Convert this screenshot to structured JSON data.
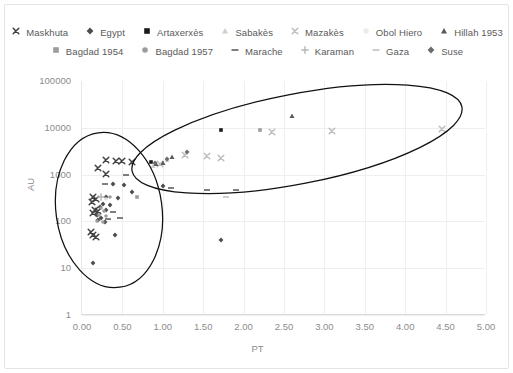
{
  "chart_data": {
    "type": "scatter",
    "title": "",
    "xlabel": "PT",
    "ylabel": "AU",
    "xlim": [
      0.0,
      5.0
    ],
    "ylim": [
      1,
      100000
    ],
    "yscale": "log",
    "xscale": "linear",
    "grid": true,
    "legend_position": "top",
    "xticks": [
      "0.00",
      "0.50",
      "1.00",
      "1.50",
      "2.00",
      "2.50",
      "3.00",
      "3.50",
      "4.00",
      "4.50",
      "5.00"
    ],
    "yticks": [
      "1",
      "10",
      "100",
      "1000",
      "10000",
      "100000"
    ],
    "annotations": [
      {
        "name": "cluster-ellipse-left",
        "note": "tall narrow ellipse enclosing dense low-PT cluster"
      },
      {
        "name": "cluster-ellipse-right",
        "note": "wide flat ellipse enclosing high-PT high-AU points"
      }
    ],
    "series": [
      {
        "name": "Maskhuta",
        "marker": "x",
        "color": "#404040",
        "points": [
          [
            0.3,
            2050
          ],
          [
            0.42,
            2000
          ],
          [
            0.5,
            1950
          ],
          [
            0.2,
            1400
          ],
          [
            0.3,
            1050
          ],
          [
            0.14,
            330
          ],
          [
            0.17,
            300
          ],
          [
            0.12,
            260
          ],
          [
            0.16,
            175
          ],
          [
            0.2,
            170
          ],
          [
            0.13,
            150
          ],
          [
            0.11,
            60
          ],
          [
            0.14,
            52
          ],
          [
            0.17,
            46
          ],
          [
            0.62,
            1900
          ]
        ]
      },
      {
        "name": "Egypt",
        "marker": "diamond",
        "color": "#4d4d4d",
        "points": [
          [
            0.38,
            620
          ],
          [
            0.52,
            600
          ],
          [
            0.62,
            430
          ],
          [
            0.3,
            330
          ],
          [
            0.45,
            310
          ],
          [
            0.26,
            230
          ],
          [
            0.35,
            220
          ],
          [
            0.22,
            200
          ],
          [
            0.3,
            175
          ],
          [
            0.18,
            140
          ],
          [
            0.23,
            120
          ],
          [
            0.2,
            105
          ],
          [
            0.41,
            52
          ],
          [
            0.13,
            13
          ],
          [
            1.72,
            40
          ],
          [
            1.0,
            560
          ],
          [
            0.28,
            95
          ]
        ]
      },
      {
        "name": "Artaxerxès",
        "marker": "square",
        "color": "#1a1a1a",
        "points": [
          [
            1.72,
            9000
          ],
          [
            0.86,
            1850
          ]
        ]
      },
      {
        "name": "Sabakès",
        "marker": "triangle",
        "color": "#cfcfcf",
        "points": [
          [
            0.88,
            1500
          ],
          [
            1.05,
            2100
          ]
        ]
      },
      {
        "name": "Mazakès",
        "marker": "x",
        "color": "#bdbdbd",
        "points": [
          [
            1.28,
            2650
          ],
          [
            1.55,
            2500
          ],
          [
            2.35,
            8000
          ],
          [
            3.1,
            8500
          ],
          [
            4.45,
            9500
          ],
          [
            1.72,
            2300
          ],
          [
            0.96,
            1650
          ]
        ]
      },
      {
        "name": "Obol Hiero",
        "marker": "circle",
        "color": "#e0e0e0",
        "points": [
          [
            0.3,
            300
          ]
        ]
      },
      {
        "name": "Hillah 1953",
        "marker": "triangle",
        "color": "#595959",
        "points": [
          [
            2.6,
            18000
          ],
          [
            1.12,
            2400
          ],
          [
            1.0,
            1800
          ],
          [
            0.92,
            1700
          ]
        ]
      },
      {
        "name": "Bagdad 1954",
        "marker": "square",
        "color": "#9c9c9c",
        "points": [
          [
            2.2,
            9000
          ],
          [
            0.68,
            340
          ]
        ]
      },
      {
        "name": "Bagdad 1957",
        "marker": "circle",
        "color": "#9c9c9c",
        "points": [
          [
            0.35,
            340
          ],
          [
            0.24,
            190
          ],
          [
            0.27,
            165
          ],
          [
            0.21,
            140
          ],
          [
            0.3,
            130
          ],
          [
            0.19,
            100
          ],
          [
            0.26,
            95
          ]
        ]
      },
      {
        "name": "Marache",
        "marker": "dash",
        "color": "#555555",
        "points": [
          [
            0.55,
            1000
          ],
          [
            0.28,
            620
          ],
          [
            0.38,
            160
          ],
          [
            0.32,
            110
          ],
          [
            0.47,
            120
          ],
          [
            1.1,
            520
          ],
          [
            1.55,
            480
          ],
          [
            1.9,
            470
          ]
        ]
      },
      {
        "name": "Karaman",
        "marker": "plus",
        "color": "#b5b5b5",
        "points": [
          [
            0.24,
            330
          ]
        ]
      },
      {
        "name": "Gaza",
        "marker": "dash",
        "color": "#bdbdbd",
        "points": [
          [
            1.78,
            330
          ]
        ]
      },
      {
        "name": "Suse",
        "marker": "diamond",
        "color": "#6b6b6b",
        "points": [
          [
            1.3,
            3000
          ],
          [
            1.05,
            2200
          ],
          [
            0.9,
            1750
          ]
        ]
      }
    ]
  },
  "legend": {
    "rows": [
      [
        {
          "label": "Maskhuta",
          "marker": "x",
          "color": "#404040"
        },
        {
          "label": "Egypt",
          "marker": "diamond",
          "color": "#4d4d4d"
        },
        {
          "label": "Artaxerxès",
          "marker": "square",
          "color": "#1a1a1a"
        },
        {
          "label": "Sabakès",
          "marker": "triangle",
          "color": "#cfcfcf"
        },
        {
          "label": "Mazakès",
          "marker": "x",
          "color": "#bdbdbd"
        },
        {
          "label": "Obol Hiero",
          "marker": "circle",
          "color": "#ececec"
        },
        {
          "label": "Hillah 1953",
          "marker": "triangle",
          "color": "#595959"
        }
      ],
      [
        {
          "label": "Bagdad 1954",
          "marker": "square",
          "color": "#9c9c9c"
        },
        {
          "label": "Bagdad 1957",
          "marker": "circle",
          "color": "#9c9c9c"
        },
        {
          "label": "Marache",
          "marker": "dash",
          "color": "#555555"
        },
        {
          "label": "Karaman",
          "marker": "plus",
          "color": "#b5b5b5"
        },
        {
          "label": "Gaza",
          "marker": "dash",
          "color": "#bdbdbd"
        },
        {
          "label": "Suse",
          "marker": "diamond",
          "color": "#6b6b6b"
        }
      ]
    ]
  }
}
